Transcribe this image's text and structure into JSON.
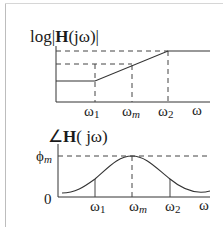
{
  "diagram": {
    "magnitude_plot": {
      "y_label_prefix": "log|",
      "y_label_H": "H",
      "y_label_arg": "(jω)|",
      "x_ticks": [
        {
          "base": "ω",
          "sub": "1"
        },
        {
          "base": "ω",
          "sub": "m"
        },
        {
          "base": "ω",
          "sub": "2"
        }
      ],
      "x_axis_label": "ω"
    },
    "phase_plot": {
      "y_label_angle": "∠",
      "y_label_H": "H",
      "y_label_arg": "( jω)",
      "y_tick_phi": {
        "base": "ϕ",
        "sub": "m"
      },
      "y_tick_zero": "0",
      "x_ticks": [
        {
          "base": "ω",
          "sub": "1"
        },
        {
          "base": "ω",
          "sub": "m"
        },
        {
          "base": "ω",
          "sub": "2"
        }
      ],
      "x_axis_label": "ω"
    },
    "colors": {
      "line": "#333333",
      "dash": "#444444",
      "text": "#1a1a1a"
    }
  }
}
